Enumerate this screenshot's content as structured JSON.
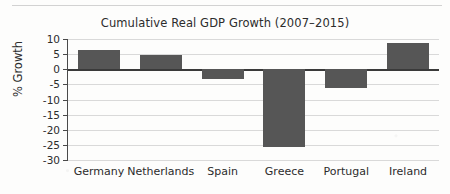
{
  "chart_data": {
    "type": "bar",
    "title": "Cumulative Real GDP Growth (2007–2015)",
    "xlabel": "",
    "ylabel": "% Growth",
    "categories": [
      "Germany",
      "Netherlands",
      "Spain",
      "Greece",
      "Portugal",
      "Ireland"
    ],
    "values": [
      6.4,
      4.7,
      -3.1,
      -25.7,
      -6.2,
      8.8
    ],
    "ylim": [
      -30,
      10
    ],
    "ytick_step": 5,
    "yticks": [
      10,
      5,
      0,
      -5,
      -10,
      -15,
      -20,
      -25,
      -30
    ],
    "ytick_labels": [
      "10",
      "5",
      "0",
      "-5",
      "-10",
      "-15",
      "-20",
      "-25",
      "-30"
    ],
    "grid": true,
    "legend": false,
    "bar_color": "#565656",
    "gridline_color": "#d9d9d9",
    "axis_color": "#4a4a4a",
    "zero_line_color": "#3a3a3a",
    "background_color": "#fdfdfc"
  }
}
